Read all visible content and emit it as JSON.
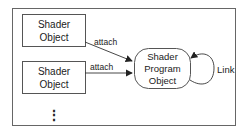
{
  "diagram": {
    "title": "",
    "nodes": [
      {
        "id": "shader1",
        "line1": "Shader",
        "line2": "Object"
      },
      {
        "id": "shader2",
        "line1": "Shader",
        "line2": "Object"
      },
      {
        "id": "program",
        "line1": "Shader",
        "line2": "Program",
        "line3": "Object"
      }
    ],
    "edges": [
      {
        "from": "shader1",
        "to": "program",
        "label": "attach"
      },
      {
        "from": "shader2",
        "to": "program",
        "label": "attach"
      },
      {
        "from": "program",
        "to": "program",
        "label": "Link"
      }
    ],
    "ellipsis": "⋮",
    "colors": {
      "stroke": "#555555",
      "text": "#222222",
      "background": "#ffffff"
    }
  }
}
